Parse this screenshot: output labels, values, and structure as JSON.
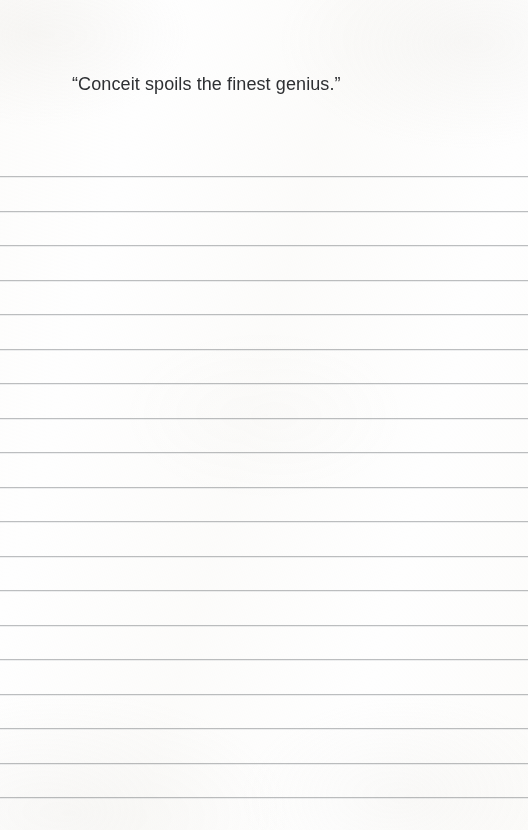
{
  "document": {
    "type": "lined-notebook-page",
    "page_width": 528,
    "page_height": 830,
    "background_color": "#fefefe"
  },
  "header": {
    "quote": "“Conceit spoils the finest genius.”",
    "quote_text_color": "#2e3033",
    "quote_left": 72,
    "quote_top": 72,
    "quote_font_size": "18px"
  },
  "ruled_lines": {
    "line_color": "#b9bbbd",
    "line_thickness": 1,
    "first_line_y": 176,
    "spacing": 34.5,
    "count": 19,
    "full_bleed": true,
    "positions": [
      176,
      210.5,
      245,
      279.5,
      314,
      348.5,
      383,
      417.5,
      452,
      486.5,
      521,
      555.5,
      590,
      624.5,
      659,
      693.5,
      728,
      762.5,
      797
    ],
    "labels": [
      "line-1",
      "line-2",
      "line-3",
      "line-4",
      "line-5",
      "line-6",
      "line-7",
      "line-8",
      "line-9",
      "line-10",
      "line-11",
      "line-12",
      "line-13",
      "line-14",
      "line-15",
      "line-16",
      "line-17",
      "line-18",
      "line-19"
    ]
  },
  "writing_area": {
    "placeholder": ""
  }
}
